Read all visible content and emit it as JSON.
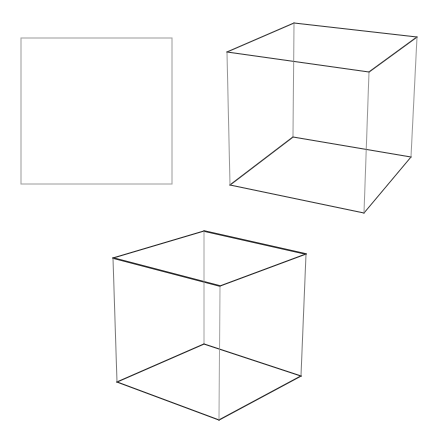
{
  "figure": {
    "width": 439,
    "height": 444,
    "background": "#ffffff",
    "square": {
      "stroke": "#9a9a9a",
      "stroke_width": 1,
      "x": 21,
      "y": 38,
      "w": 151,
      "h": 146
    },
    "cubes": [
      {
        "name": "cube-top-right",
        "stroke": "#333333",
        "vertices": {
          "top_back": [
            294,
            23
          ],
          "top_right": [
            417,
            37
          ],
          "top_left": [
            227,
            52
          ],
          "top_front": [
            369,
            72
          ],
          "bottom_back": [
            293,
            137
          ],
          "bottom_right": [
            411,
            157
          ],
          "bottom_left": [
            230,
            185
          ],
          "bottom_front": [
            364,
            213
          ]
        },
        "edges": [
          [
            "top_back",
            "top_right",
            1.1,
            "#333333"
          ],
          [
            "top_back",
            "top_left",
            1.1,
            "#333333"
          ],
          [
            "top_left",
            "top_front",
            1.1,
            "#333333"
          ],
          [
            "top_front",
            "top_right",
            1.1,
            "#333333"
          ],
          [
            "bottom_back",
            "bottom_right",
            1.1,
            "#333333"
          ],
          [
            "bottom_back",
            "bottom_left",
            1.1,
            "#333333"
          ],
          [
            "bottom_left",
            "bottom_front",
            1.1,
            "#333333"
          ],
          [
            "bottom_front",
            "bottom_right",
            1.1,
            "#333333"
          ],
          [
            "top_back",
            "bottom_back",
            0.8,
            "#777777"
          ],
          [
            "top_left",
            "bottom_left",
            0.8,
            "#777777"
          ],
          [
            "top_front",
            "bottom_front",
            0.8,
            "#777777"
          ],
          [
            "top_right",
            "bottom_right",
            0.8,
            "#777777"
          ]
        ]
      },
      {
        "name": "cube-bottom",
        "stroke": "#222222",
        "vertices": {
          "top_back": [
            204,
            231
          ],
          "top_left": [
            113,
            258
          ],
          "top_right": [
            306,
            254
          ],
          "top_front": [
            220,
            286
          ],
          "bottom_back": [
            204,
            344
          ],
          "bottom_left": [
            117,
            382
          ],
          "bottom_right": [
            301,
            376
          ],
          "bottom_front": [
            219,
            420
          ]
        },
        "edges": [
          [
            "top_back",
            "top_left",
            1.3,
            "#222222"
          ],
          [
            "top_back",
            "top_right",
            1.3,
            "#222222"
          ],
          [
            "top_left",
            "top_front",
            1.3,
            "#222222"
          ],
          [
            "top_front",
            "top_right",
            1.3,
            "#222222"
          ],
          [
            "bottom_back",
            "bottom_left",
            1.3,
            "#222222"
          ],
          [
            "bottom_back",
            "bottom_right",
            1.3,
            "#222222"
          ],
          [
            "bottom_left",
            "bottom_front",
            1.3,
            "#222222"
          ],
          [
            "bottom_front",
            "bottom_right",
            1.3,
            "#222222"
          ],
          [
            "top_back",
            "bottom_back",
            0.8,
            "#888888"
          ],
          [
            "top_left",
            "bottom_left",
            0.9,
            "#666666"
          ],
          [
            "top_front",
            "bottom_front",
            0.8,
            "#888888"
          ],
          [
            "top_right",
            "bottom_right",
            0.9,
            "#666666"
          ]
        ]
      }
    ]
  }
}
